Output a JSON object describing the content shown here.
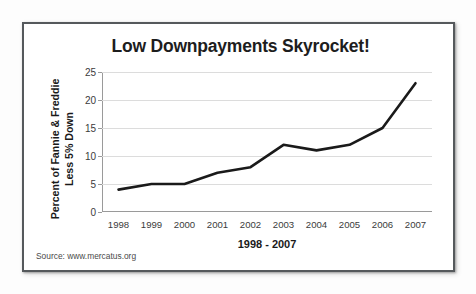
{
  "chart_data": {
    "type": "line",
    "title": "Low Downpayments Skyrocket!",
    "xlabel": "1998 - 2007",
    "ylabel": "Percent of Fannie & Freddie Less 5% Down",
    "ylabel_lines": [
      "Percent of Fannie & Freddie",
      "Less 5% Down"
    ],
    "categories": [
      "1998",
      "1999",
      "2000",
      "2001",
      "2002",
      "2003",
      "2004",
      "2005",
      "2006",
      "2007"
    ],
    "values": [
      4,
      5,
      5,
      7,
      8,
      12,
      11,
      12,
      15,
      23
    ],
    "series": [
      {
        "name": "Percent of Fannie & Freddie Less 5% Down",
        "values": [
          4,
          5,
          5,
          7,
          8,
          12,
          11,
          12,
          15,
          23
        ]
      }
    ],
    "ylim": [
      0,
      25
    ],
    "yticks": [
      0,
      5,
      10,
      15,
      20,
      25
    ],
    "ytick_labels": [
      "0",
      "5",
      "10",
      "15",
      "20",
      "25"
    ],
    "grid": "horizontal",
    "legend": "none",
    "line_color": "#1a1a1a",
    "grid_color": "#dcdcdc",
    "axis_color": "#9a9a9a"
  },
  "source_note": "Source: www.mercatus.org",
  "frame": {
    "border_color": "#55595c",
    "background": "#ffffff"
  }
}
